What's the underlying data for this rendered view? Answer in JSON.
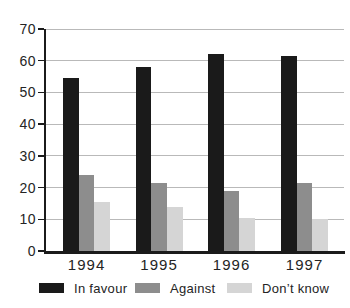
{
  "chart_data": {
    "type": "bar",
    "title": "",
    "xlabel": "",
    "ylabel": "",
    "categories": [
      "1994",
      "1995",
      "1996",
      "1997"
    ],
    "series": [
      {
        "name": "In favour",
        "color": "#1a1a1a",
        "values": [
          54.5,
          58,
          62,
          61.5
        ]
      },
      {
        "name": "Against",
        "color": "#8d8d8d",
        "values": [
          24,
          21.5,
          19,
          21.5
        ]
      },
      {
        "name": "Don’t know",
        "color": "#d5d5d5",
        "values": [
          15.5,
          14,
          10.5,
          10
        ]
      }
    ],
    "ylim": [
      0,
      70
    ],
    "yticks": [
      0,
      10,
      20,
      30,
      40,
      50,
      60,
      70
    ],
    "grid": true,
    "gridline_color": "#b9b9b9",
    "axis_color": "#1b1b1b",
    "legend_position": "bottom"
  }
}
